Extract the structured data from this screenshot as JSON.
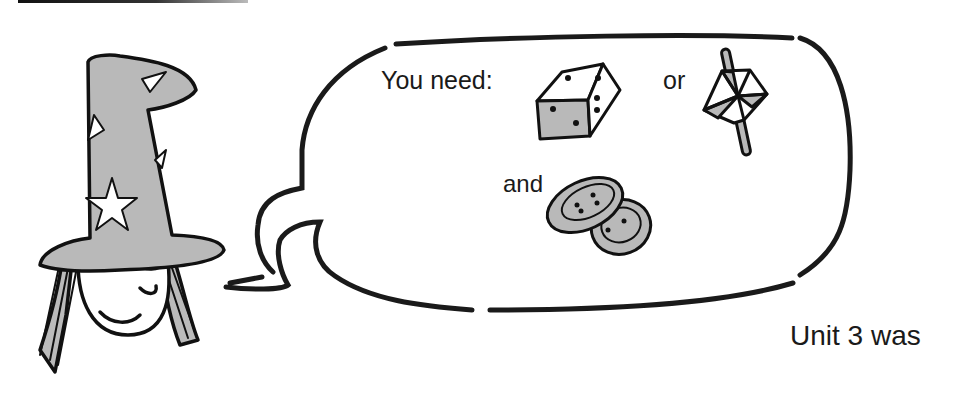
{
  "page": {
    "top_rule": true,
    "speech_bubble": {
      "intro_label": "You need:",
      "item_1": "die-icon",
      "connector_or": "or",
      "item_2": "spinner-icon",
      "connector_and": "and",
      "item_3": "buttons-icon"
    },
    "character": "wizard-witch-illustration",
    "footer_text": "Unit 3 was",
    "colors": {
      "ink": "#1a1a1a",
      "fill_gray": "#b9b9b9",
      "background": "#ffffff"
    }
  }
}
